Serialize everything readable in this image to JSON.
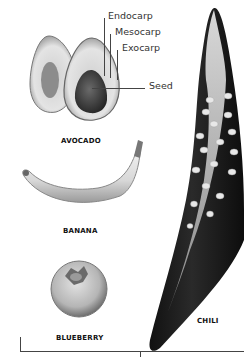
{
  "diagram": {
    "type": "fruit anatomy comparison (berries)",
    "avocado_parts": [
      {
        "label": "Endocarp"
      },
      {
        "label": "Mesocarp"
      },
      {
        "label": "Exocarp"
      },
      {
        "label": "Seed"
      }
    ],
    "fruits": [
      {
        "name": "AVOCADO"
      },
      {
        "name": "BANANA"
      },
      {
        "name": "BLUEBERRY"
      },
      {
        "name": "CHILI"
      }
    ]
  },
  "colors": {
    "background": "#ffffff",
    "text": "#222222",
    "leader_lines": "#444444",
    "chili_dark": "#1a1a1a"
  }
}
